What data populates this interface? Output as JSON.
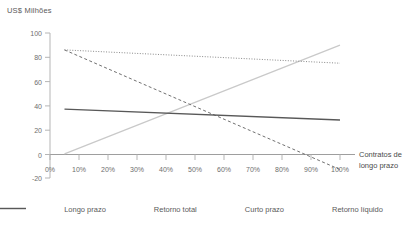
{
  "chart_data": {
    "type": "line",
    "title": "",
    "ylabel": "US$ Milhões",
    "xlabel": "",
    "annotation": [
      "Contratos de",
      "longo prazo"
    ],
    "ylim": [
      -20,
      100
    ],
    "xlim": [
      0,
      100
    ],
    "grid": false,
    "legend_position": "bottom",
    "yticks": [
      100,
      80,
      60,
      40,
      20,
      0,
      -20
    ],
    "ytick_labels": [
      "100",
      "80",
      "60",
      "40",
      "20",
      "0",
      "-20"
    ],
    "xticks": [
      0,
      10,
      20,
      30,
      40,
      50,
      60,
      70,
      80,
      90,
      100
    ],
    "xtick_labels": [
      "0%",
      "10%",
      "20%",
      "30%",
      "40%",
      "50%",
      "60%",
      "70%",
      "80%",
      "90%",
      "100%"
    ],
    "series": [
      {
        "name": "Longo prazo",
        "style": "solid-light",
        "color": "#c9c9c9",
        "x": [
          5,
          100
        ],
        "values": [
          0,
          90
        ]
      },
      {
        "name": "Retorno total",
        "style": "dotted",
        "color": "#8a8a8a",
        "x": [
          5,
          100
        ],
        "values": [
          86,
          75
        ]
      },
      {
        "name": "Curto prazo",
        "style": "dashed",
        "color": "#707070",
        "x": [
          5,
          100
        ],
        "values": [
          86,
          -13
        ]
      },
      {
        "name": "Retorno líquido",
        "style": "solid-dark",
        "color": "#585858",
        "x": [
          5,
          100
        ],
        "values": [
          37,
          28
        ]
      }
    ]
  },
  "axis": {
    "y_title": "US$ Milhões"
  },
  "legend": {
    "items": [
      {
        "label": "Longo prazo"
      },
      {
        "label": "Retorno total"
      },
      {
        "label": "Curto prazo"
      },
      {
        "label": "Retorno líquido"
      }
    ]
  },
  "annotation": {
    "line1": "Contratos de",
    "line2": "longo prazo"
  },
  "colors": {
    "axis": "#b5b5b5",
    "text": "#5a5a5a",
    "longo_prazo": "#c9c9c9",
    "retorno_total": "#8a8a8a",
    "curto_prazo": "#707070",
    "retorno_liquido": "#585858"
  }
}
